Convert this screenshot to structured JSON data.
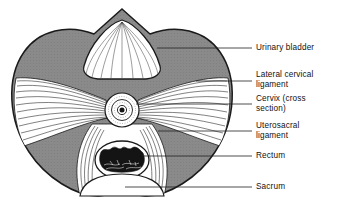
{
  "figure": {
    "view": "transverse section through pelvis at level of cervix"
  },
  "colors": {
    "pelvic_fill": "#8a8a8a",
    "outline": "#1a1a1a",
    "organ_fill": "#ffffff",
    "lumen_dark": "#141414",
    "leader": "#222222",
    "background": "#ffffff"
  },
  "labels": [
    {
      "id": "urinary-bladder",
      "text": "Urinary bladder",
      "text_x": 256,
      "text_y": 43,
      "leader_x1": 157,
      "leader_y1": 48,
      "leader_x2": 252
    },
    {
      "id": "lateral-cervical-ligament",
      "text": "Lateral cervical\nligament",
      "text_x": 256,
      "text_y": 70,
      "leader_x1": 196,
      "leader_y1": 81,
      "leader_x2": 252
    },
    {
      "id": "cervix",
      "text": "Cervix (cross\nsection)",
      "text_x": 256,
      "text_y": 94,
      "leader_x1": 136,
      "leader_y1": 104,
      "leader_x2": 252
    },
    {
      "id": "uterosacral-ligament",
      "text": "Uterosacral\nligament",
      "text_x": 256,
      "text_y": 121,
      "leader_x1": 158,
      "leader_y1": 131,
      "leader_x2": 252
    },
    {
      "id": "rectum",
      "text": "Rectum",
      "text_x": 256,
      "text_y": 151,
      "leader_x1": 142,
      "leader_y1": 156,
      "leader_x2": 252
    },
    {
      "id": "sacrum",
      "text": "Sacrum",
      "text_x": 256,
      "text_y": 182,
      "leader_x1": 125,
      "leader_y1": 187,
      "leader_x2": 252
    }
  ],
  "structures": {
    "pelvis_outline": "heart-shaped pelvic brim with apex notch at top center",
    "bladder": {
      "cx": 122,
      "cy": 48,
      "shape": "dome with radiating mucosal folds"
    },
    "cervix": {
      "cx": 122,
      "cy": 110,
      "r_outer": 17,
      "r_mid": 11,
      "r_core": 4
    },
    "rectum": {
      "cx": 122,
      "cy": 160,
      "rx": 26,
      "ry": 18
    },
    "sacrum": {
      "cx": 122,
      "cy": 196,
      "shape": "convex white promontory at base"
    }
  }
}
